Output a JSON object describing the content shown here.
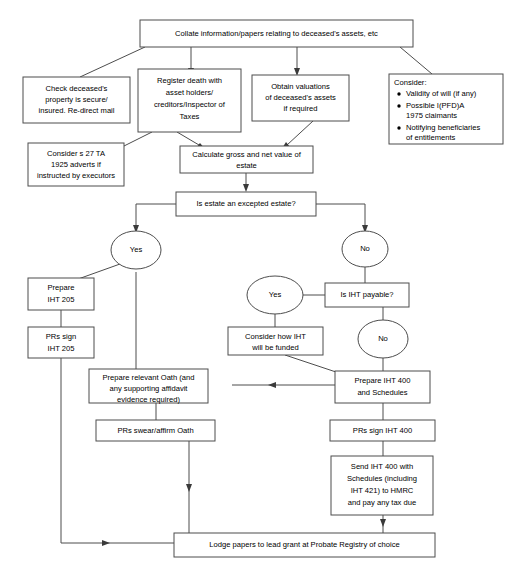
{
  "diagram": {
    "colors": {
      "box_stroke": "#4d4d4d",
      "box_fill": "#ffffff",
      "text": "#000000",
      "arrow": "#3a3a3a",
      "background": "#ffffff"
    }
  },
  "nodes": {
    "collate": {
      "id": "collate",
      "shape": "rect",
      "lines": [
        "Collate information/papers relating to deceased's assets, etc"
      ]
    },
    "check_property": {
      "id": "check_property",
      "shape": "rect",
      "lines": [
        "Check deceased's",
        "property is secure/",
        "insured. Re-direct mail"
      ]
    },
    "register_death": {
      "id": "register_death",
      "shape": "rect",
      "lines": [
        "Register death with",
        "asset holders/",
        "creditors/Inspector of",
        "Taxes"
      ]
    },
    "obtain_valuations": {
      "id": "obtain_valuations",
      "shape": "rect",
      "lines": [
        "Obtain valuations",
        "of deceased's assets",
        "if required"
      ]
    },
    "consider_list": {
      "id": "consider_list",
      "shape": "rect",
      "heading": "Consider:",
      "bullets": [
        [
          "Validity of will (if any)"
        ],
        [
          "Possible I(PFD)A",
          "1975 claimants"
        ],
        [
          "Notifying beneficiaries",
          "of entitlements"
        ]
      ]
    },
    "s27_adverts": {
      "id": "s27_adverts",
      "shape": "rect",
      "lines": [
        "Consider s 27 TA",
        "1925 adverts if",
        "instructed by executors"
      ]
    },
    "calculate_value": {
      "id": "calculate_value",
      "shape": "rect",
      "lines": [
        "Calculate gross and net value of",
        "estate"
      ]
    },
    "excepted_estate": {
      "id": "excepted_estate",
      "shape": "rect",
      "lines": [
        "Is estate an excepted estate?"
      ]
    },
    "yes_excepted": {
      "id": "yes_excepted",
      "shape": "ellipse",
      "lines": [
        "Yes"
      ]
    },
    "no_excepted": {
      "id": "no_excepted",
      "shape": "ellipse",
      "lines": [
        "No"
      ]
    },
    "prepare_iht205": {
      "id": "prepare_iht205",
      "shape": "rect",
      "lines": [
        "Prepare",
        "IHT 205"
      ]
    },
    "prs_sign_iht205": {
      "id": "prs_sign_iht205",
      "shape": "rect",
      "lines": [
        "PRs sign",
        "IHT 205"
      ]
    },
    "iht_payable": {
      "id": "iht_payable",
      "shape": "rect",
      "lines": [
        "Is IHT payable?"
      ]
    },
    "yes_iht": {
      "id": "yes_iht",
      "shape": "ellipse",
      "lines": [
        "Yes"
      ]
    },
    "no_iht": {
      "id": "no_iht",
      "shape": "ellipse",
      "lines": [
        "No"
      ]
    },
    "consider_funding": {
      "id": "consider_funding",
      "shape": "rect",
      "lines": [
        "Consider how IHT",
        "will be funded"
      ]
    },
    "prepare_oath": {
      "id": "prepare_oath",
      "shape": "rect",
      "lines": [
        "Prepare relevant Oath (and",
        "any supporting affidavit",
        "evidence required)"
      ]
    },
    "prepare_iht400": {
      "id": "prepare_iht400",
      "shape": "rect",
      "lines": [
        "Prepare IHT 400",
        "and Schedules"
      ]
    },
    "prs_swear_oath": {
      "id": "prs_swear_oath",
      "shape": "rect",
      "lines": [
        "PRs swear/affirm Oath"
      ]
    },
    "prs_sign_iht400": {
      "id": "prs_sign_iht400",
      "shape": "rect",
      "lines": [
        "PRs sign IHT 400"
      ]
    },
    "send_iht400": {
      "id": "send_iht400",
      "shape": "rect",
      "lines": [
        "Send IHT 400 with",
        "Schedules (including",
        "IHT 421) to HMRC",
        "and pay any tax due"
      ]
    },
    "lodge_papers": {
      "id": "lodge_papers",
      "shape": "rect",
      "lines": [
        "Lodge papers to lead grant at Probate Registry of choice"
      ]
    }
  }
}
